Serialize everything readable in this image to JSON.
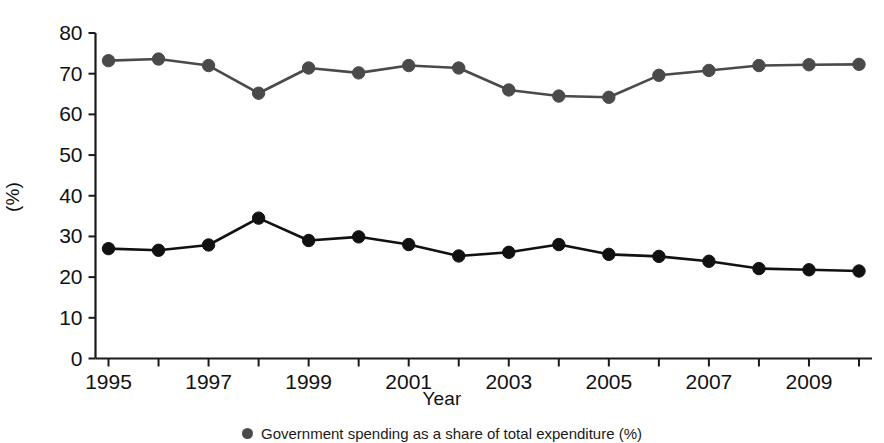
{
  "chart_data": {
    "type": "line",
    "title": "",
    "subtitle": "",
    "xlabel": "Year",
    "ylabel": "(%)",
    "xlim": [
      1995,
      2010
    ],
    "ylim": [
      0,
      80
    ],
    "grid": false,
    "legend_position": "bottom",
    "x": [
      1995,
      1996,
      1997,
      1998,
      1999,
      2000,
      2001,
      2002,
      2003,
      2004,
      2005,
      2006,
      2007,
      2008,
      2009,
      2010
    ],
    "xtick_labels": [
      "1995",
      "",
      "1997",
      "",
      "1999",
      "",
      "2001",
      "",
      "2003",
      "",
      "2005",
      "",
      "2007",
      "",
      "2009",
      ""
    ],
    "xtick_major": [
      "1995",
      "1997",
      "1999",
      "2001",
      "2003",
      "2005",
      "2007",
      "2009"
    ],
    "ytick_labels": [
      "0",
      "10",
      "20",
      "30",
      "40",
      "50",
      "60",
      "70",
      "80"
    ],
    "yticks": [
      0,
      10,
      20,
      30,
      40,
      50,
      60,
      70,
      80
    ],
    "series": [
      {
        "name": "upper-series",
        "color": "#4a4a4a",
        "marker": "circle",
        "values": [
          73.2,
          73.6,
          72.0,
          65.2,
          71.4,
          70.2,
          72.0,
          71.4,
          66.0,
          64.5,
          64.2,
          69.6,
          70.8,
          72.0,
          72.2,
          72.3
        ]
      },
      {
        "name": "lower-series",
        "color": "#111111",
        "marker": "circle",
        "values": [
          27.0,
          26.6,
          27.9,
          34.5,
          29.0,
          29.9,
          28.0,
          25.2,
          26.1,
          28.0,
          25.6,
          25.1,
          23.9,
          22.1,
          21.8,
          21.5
        ]
      }
    ],
    "legend_entries": [
      {
        "swatch_color": "#4a4a4a",
        "label": "Government spending as a share of total expenditure (%)"
      }
    ]
  },
  "axis": {
    "x_title": "Year",
    "y_title": "(%)"
  }
}
